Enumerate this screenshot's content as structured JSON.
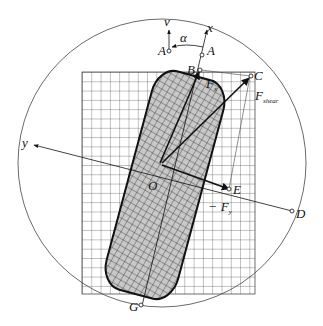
{
  "figure": {
    "labels": {
      "v_axis": "v",
      "x_axis": "x",
      "y_axis": "y",
      "alpha": "α",
      "A_left": "A",
      "A_right": "A",
      "B": "B",
      "C": "C",
      "D": "D",
      "E": "E",
      "G": "G",
      "O": "O",
      "Fx": "F",
      "Fx_sub": "x",
      "Fshear": "F",
      "Fshear_sub": "shear",
      "Fy": "F",
      "Fy_sub": "y",
      "Fy_sign": "−"
    }
  }
}
